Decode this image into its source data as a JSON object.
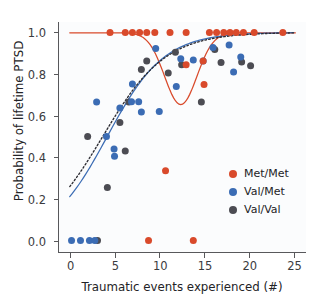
{
  "chart_data": {
    "type": "scatter",
    "title": "",
    "xlabel": "Traumatic events experienced (#)",
    "ylabel": "Probability of lifetime PTSD",
    "xlim": [
      -1.2,
      26.5
    ],
    "ylim": [
      -0.06,
      1.05
    ],
    "xticks": [
      0,
      5,
      10,
      15,
      20,
      25
    ],
    "xtick_labels": [
      "0",
      "5",
      "10",
      "15",
      "20",
      "25"
    ],
    "yticks": [
      0.0,
      0.2,
      0.4,
      0.6,
      0.8,
      1.0
    ],
    "ytick_labels": [
      "0.0",
      "0.2",
      "0.4",
      "0.6",
      "0.8",
      "1.0"
    ],
    "grid": false,
    "legend_position": "lower right",
    "colors": {
      "met_met": "#d94a2b",
      "val_met": "#3b6cb4",
      "val_val": "#4c4c53",
      "axis": "#58585b",
      "background": "#fbfcfd"
    },
    "series": [
      {
        "name": "Met/Met",
        "color": "#d94a2b",
        "marker": "circle",
        "points": [
          [
            4.5,
            1.0
          ],
          [
            6.2,
            1.0
          ],
          [
            7.0,
            1.0
          ],
          [
            7.8,
            1.0
          ],
          [
            8.6,
            1.0
          ],
          [
            9.5,
            1.0
          ],
          [
            11.2,
            1.0
          ],
          [
            13.0,
            1.0
          ],
          [
            15.6,
            1.0
          ],
          [
            16.4,
            1.0
          ],
          [
            17.2,
            1.0
          ],
          [
            17.9,
            1.0
          ],
          [
            18.6,
            1.0
          ],
          [
            19.4,
            1.0
          ],
          [
            20.6,
            1.0
          ],
          [
            23.8,
            1.0
          ],
          [
            13.0,
            0.845
          ],
          [
            14.9,
            0.862
          ],
          [
            15.0,
            0.75
          ],
          [
            10.7,
            0.335
          ],
          [
            8.8,
            0.0
          ],
          [
            13.8,
            0.0
          ]
        ]
      },
      {
        "name": "Val/Met",
        "color": "#3b6cb4",
        "marker": "circle",
        "points": [
          [
            9.6,
            0.923
          ],
          [
            17.8,
            0.94
          ],
          [
            16.0,
            0.927
          ],
          [
            12.4,
            0.873
          ],
          [
            11.9,
            0.74
          ],
          [
            7.0,
            0.752
          ],
          [
            19.1,
            0.882
          ],
          [
            18.3,
            0.81
          ],
          [
            13.8,
            0.868
          ],
          [
            5.6,
            0.637
          ],
          [
            3.0,
            0.665
          ],
          [
            8.0,
            0.617
          ],
          [
            10.0,
            0.62
          ],
          [
            4.1,
            0.5
          ],
          [
            5.0,
            0.405
          ],
          [
            4.95,
            0.44
          ],
          [
            6.9,
            0.667
          ],
          [
            7.7,
            0.667
          ],
          [
            14.9,
            0.862
          ],
          [
            0.2,
            0.0
          ],
          [
            1.2,
            0.0
          ],
          [
            2.2,
            0.0
          ],
          [
            2.8,
            0.0
          ]
        ]
      },
      {
        "name": "Val/Val",
        "color": "#4c4c53",
        "marker": "circle",
        "points": [
          [
            11.8,
            0.905
          ],
          [
            16.2,
            0.918
          ],
          [
            8.6,
            0.862
          ],
          [
            16.9,
            0.855
          ],
          [
            8.0,
            0.822
          ],
          [
            11.0,
            0.805
          ],
          [
            12.5,
            0.845
          ],
          [
            19.2,
            0.858
          ],
          [
            20.2,
            0.84
          ],
          [
            5.6,
            0.567
          ],
          [
            2.0,
            0.5
          ],
          [
            6.2,
            0.43
          ],
          [
            6.6,
            0.665
          ],
          [
            14.7,
            0.665
          ],
          [
            4.2,
            0.255
          ],
          [
            3.1,
            0.0
          ]
        ]
      }
    ],
    "curves": [
      {
        "name": "Met/Met fit",
        "color": "#d94a2b",
        "style": "solid",
        "description": "near 1.0 at left, dips to ~0.66 near x=12.5, rises back to ~1.0 by x=17"
      },
      {
        "name": "Val/Met fit",
        "color": "#3b6cb4",
        "style": "solid",
        "description": "logistic rising from ~0.21 at x=0 to ~0.95 at x=25"
      },
      {
        "name": "Val/Val fit",
        "color": "#2c2c33",
        "style": "dotted",
        "description": "logistic rising from ~0.26 at x=0 to ~0.94 at x=25"
      }
    ],
    "legend": [
      {
        "label": "Met/Met",
        "color": "#d94a2b"
      },
      {
        "label": "Val/Met",
        "color": "#3b6cb4"
      },
      {
        "label": "Val/Val",
        "color": "#4c4c53"
      }
    ]
  }
}
